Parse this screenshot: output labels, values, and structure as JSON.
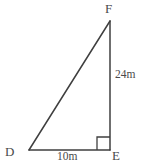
{
  "figure": {
    "type": "right-triangle-diagram",
    "background_color": "#ffffff",
    "stroke_color": "#3f3f3f",
    "text_color": "#4a4a4a",
    "vertices": {
      "f": {
        "label": "F",
        "x": 110,
        "y": 21
      },
      "d": {
        "label": "D",
        "x": 29,
        "y": 150
      },
      "e": {
        "label": "E",
        "x": 110,
        "y": 150
      }
    },
    "sides": {
      "vertical": {
        "label": "24m",
        "from": "E",
        "to": "F"
      },
      "horizontal": {
        "label": "10m",
        "from": "D",
        "to": "E"
      }
    },
    "right_angle": {
      "at": "E",
      "marker": "square",
      "size": 13
    }
  }
}
